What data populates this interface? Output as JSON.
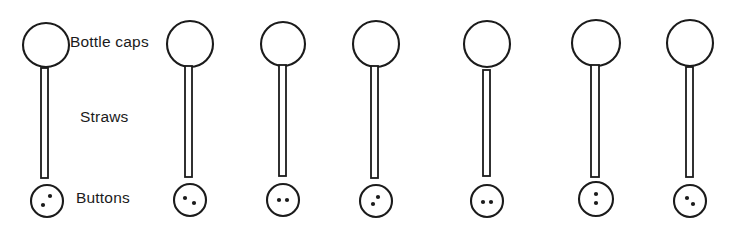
{
  "diagram": {
    "title_visible": false,
    "background_color": "#ffffff",
    "stroke_color": "#1b1b1b",
    "labels": [
      {
        "id": "bottle-caps",
        "text": "Bottle caps",
        "x": 70,
        "y": 47
      },
      {
        "id": "straws",
        "text": "Straws",
        "x": 80,
        "y": 122
      },
      {
        "id": "buttons",
        "text": "Buttons",
        "x": 76,
        "y": 203
      }
    ],
    "assemblies": [
      {
        "index": 1,
        "cap": {
          "cx": 46,
          "cy": 45,
          "rx": 23,
          "ry": 22
        },
        "straw": {
          "x": 41,
          "y": 68,
          "w": 7,
          "h": 110
        },
        "button": {
          "cx": 47,
          "cy": 201,
          "rx": 16,
          "ry": 16,
          "holes": [
            {
              "dx": 3,
              "dy": -5
            },
            {
              "dx": -4,
              "dy": 4
            }
          ]
        }
      },
      {
        "index": 2,
        "cap": {
          "cx": 190,
          "cy": 44,
          "rx": 23,
          "ry": 23
        },
        "straw": {
          "x": 185,
          "y": 66,
          "w": 7,
          "h": 111
        },
        "button": {
          "cx": 190,
          "cy": 200,
          "rx": 16,
          "ry": 16,
          "holes": [
            {
              "dx": -5,
              "dy": -2
            },
            {
              "dx": 4,
              "dy": 3
            }
          ]
        }
      },
      {
        "index": 3,
        "cap": {
          "cx": 283,
          "cy": 44,
          "rx": 22,
          "ry": 22
        },
        "straw": {
          "x": 279,
          "y": 65,
          "w": 7,
          "h": 111
        },
        "button": {
          "cx": 283,
          "cy": 200,
          "rx": 16,
          "ry": 16,
          "holes": [
            {
              "dx": -4,
              "dy": 0
            },
            {
              "dx": 4,
              "dy": 0
            }
          ]
        }
      },
      {
        "index": 4,
        "cap": {
          "cx": 376,
          "cy": 44,
          "rx": 23,
          "ry": 23
        },
        "straw": {
          "x": 371,
          "y": 66,
          "w": 7,
          "h": 112
        },
        "button": {
          "cx": 376,
          "cy": 201,
          "rx": 16,
          "ry": 16,
          "holes": [
            {
              "dx": 2,
              "dy": -4
            },
            {
              "dx": -3,
              "dy": 3
            }
          ]
        }
      },
      {
        "index": 5,
        "cap": {
          "cx": 487,
          "cy": 44,
          "rx": 23,
          "ry": 23
        },
        "straw": {
          "x": 483,
          "y": 70,
          "w": 7,
          "h": 106
        },
        "button": {
          "cx": 487,
          "cy": 201,
          "rx": 16,
          "ry": 16,
          "holes": [
            {
              "dx": -4,
              "dy": 1
            },
            {
              "dx": 4,
              "dy": 1
            }
          ]
        }
      },
      {
        "index": 6,
        "cap": {
          "cx": 596,
          "cy": 43,
          "rx": 24,
          "ry": 23
        },
        "straw": {
          "x": 591,
          "y": 65,
          "w": 8,
          "h": 112
        },
        "button": {
          "cx": 596,
          "cy": 199,
          "rx": 17,
          "ry": 17,
          "holes": [
            {
              "dx": 0,
              "dy": -5
            },
            {
              "dx": 0,
              "dy": 4
            }
          ]
        }
      },
      {
        "index": 7,
        "cap": {
          "cx": 690,
          "cy": 43,
          "rx": 23,
          "ry": 23
        },
        "straw": {
          "x": 686,
          "y": 67,
          "w": 7,
          "h": 110
        },
        "button": {
          "cx": 690,
          "cy": 201,
          "rx": 16,
          "ry": 16,
          "holes": [
            {
              "dx": -3,
              "dy": -3
            },
            {
              "dx": 3,
              "dy": 3
            }
          ]
        }
      }
    ]
  }
}
